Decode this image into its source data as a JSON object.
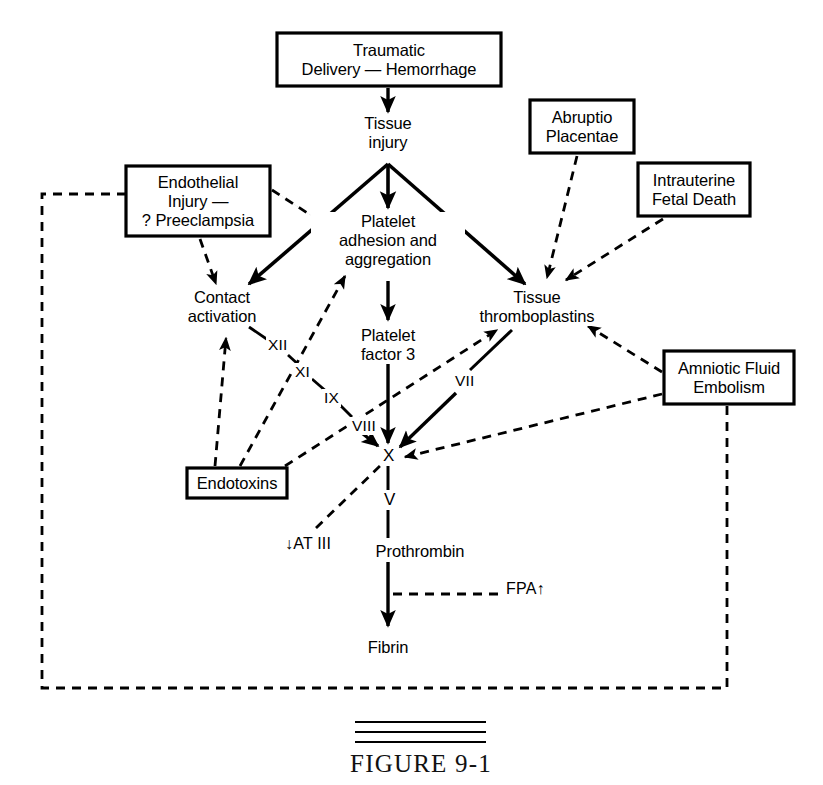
{
  "figure": {
    "caption": "FIGURE 9-1",
    "rule_count": 3
  },
  "style": {
    "ink": "#000000",
    "paper": "#ffffff"
  },
  "boxes": [
    {
      "id": "traumatic-delivery",
      "label": "Traumatic\nDelivery — Hemorrhage",
      "x": 277,
      "y": 33,
      "w": 224,
      "h": 53
    },
    {
      "id": "endothelial-injury",
      "label": "Endothelial\nInjury —\n? Preeclampsia",
      "x": 126,
      "y": 166,
      "w": 144,
      "h": 70
    },
    {
      "id": "abruptio-placentae",
      "label": "Abruptio\nPlacentae",
      "x": 530,
      "y": 100,
      "w": 104,
      "h": 53
    },
    {
      "id": "intrauterine-fetal-death",
      "label": "Intrauterine\nFetal Death",
      "x": 638,
      "y": 163,
      "w": 112,
      "h": 53
    },
    {
      "id": "amniotic-fluid-embolism",
      "label": "Amniotic Fluid\nEmbolism",
      "x": 664,
      "y": 351,
      "w": 130,
      "h": 53
    },
    {
      "id": "endotoxins",
      "label": "Endotoxins",
      "x": 187,
      "y": 468,
      "w": 100,
      "h": 30
    }
  ],
  "nodes": [
    {
      "id": "tissue-injury",
      "label": "Tissue\ninjury",
      "cx": 388,
      "cy": 135
    },
    {
      "id": "platelet-adhesion",
      "label": "Platelet\nadhesion and\naggregation",
      "cx": 388,
      "cy": 240
    },
    {
      "id": "tissue-thromboplastins",
      "label": "Tissue\nthromboplastins",
      "cx": 537,
      "cy": 307
    },
    {
      "id": "contact-activation",
      "label": "Contact\nactivation",
      "cx": 222,
      "cy": 307
    },
    {
      "id": "platelet-factor-3",
      "label": "Platelet\nfactor 3",
      "cx": 388,
      "cy": 345
    },
    {
      "id": "prothrombin",
      "label": "Prothrombin",
      "cx": 420,
      "cy": 552
    },
    {
      "id": "fibrin",
      "label": "Fibrin",
      "cx": 388,
      "cy": 648
    }
  ],
  "factors": [
    {
      "id": "factor-xii",
      "label": "XII",
      "x": 271,
      "y": 345
    },
    {
      "id": "factor-xi",
      "label": "XI",
      "x": 296,
      "y": 372
    },
    {
      "id": "factor-ix",
      "label": "IX",
      "x": 327,
      "y": 398
    },
    {
      "id": "factor-viii",
      "label": "VIII",
      "x": 344,
      "y": 425
    },
    {
      "id": "factor-vii",
      "label": "VII",
      "x": 458,
      "y": 381
    },
    {
      "id": "factor-x",
      "label": "X",
      "x": 382,
      "y": 452
    },
    {
      "id": "factor-v",
      "label": "V",
      "x": 383,
      "y": 498
    }
  ],
  "annotations": [
    {
      "id": "at-iii",
      "label": "↓AT III",
      "x": 285,
      "y": 544
    },
    {
      "id": "fpa",
      "label": "FPA↑",
      "x": 506,
      "y": 588
    }
  ],
  "edges": [
    {
      "id": "traumatic-to-tissue-injury",
      "style": "solid",
      "arrow": true,
      "from": "traumatic-delivery",
      "to": "tissue-injury"
    },
    {
      "id": "tissue-injury-to-contact",
      "style": "solid",
      "arrow": true,
      "from": "tissue-injury",
      "to": "contact-activation"
    },
    {
      "id": "tissue-injury-to-platelet",
      "style": "solid",
      "arrow": true,
      "from": "tissue-injury",
      "to": "platelet-adhesion"
    },
    {
      "id": "tissue-injury-to-thromboplastins",
      "style": "solid",
      "arrow": true,
      "from": "tissue-injury",
      "to": "tissue-thromboplastins"
    },
    {
      "id": "endothelial-to-contact",
      "style": "dashed",
      "arrow": true,
      "from": "endothelial-injury",
      "to": "contact-activation"
    },
    {
      "id": "endothelial-to-platelet",
      "style": "dashed",
      "arrow": true,
      "from": "endothelial-injury",
      "to": "platelet-adhesion"
    },
    {
      "id": "abruptio-to-thromboplastins",
      "style": "dashed",
      "arrow": true,
      "from": "abruptio-placentae",
      "to": "tissue-thromboplastins"
    },
    {
      "id": "fetal-death-to-thromboplastins",
      "style": "dashed",
      "arrow": true,
      "from": "intrauterine-fetal-death",
      "to": "tissue-thromboplastins"
    },
    {
      "id": "platelet-to-factor3",
      "style": "solid",
      "arrow": true,
      "from": "platelet-adhesion",
      "to": "platelet-factor-3"
    },
    {
      "id": "factor3-to-x",
      "style": "solid",
      "arrow": true,
      "from": "platelet-factor-3",
      "to": "factor-x"
    },
    {
      "id": "contact-to-xii-xi-ix-viii",
      "style": "solid",
      "arrow": false,
      "from": "contact-activation",
      "to": "factor-viii"
    },
    {
      "id": "ix-to-x",
      "style": "solid",
      "arrow": true,
      "from": "factor-viii",
      "to": "factor-x"
    },
    {
      "id": "thromboplastins-to-x-vii",
      "style": "solid",
      "arrow": true,
      "from": "tissue-thromboplastins",
      "to": "factor-x"
    },
    {
      "id": "amniotic-to-thromboplastins",
      "style": "dashed",
      "arrow": true,
      "from": "amniotic-fluid-embolism",
      "to": "tissue-thromboplastins"
    },
    {
      "id": "amniotic-to-x",
      "style": "dashed",
      "arrow": true,
      "from": "amniotic-fluid-embolism",
      "to": "factor-x"
    },
    {
      "id": "endotoxins-to-contact",
      "style": "dashed",
      "arrow": true,
      "from": "endotoxins",
      "to": "contact-activation"
    },
    {
      "id": "endotoxins-to-platelet",
      "style": "dashed",
      "arrow": true,
      "from": "endotoxins",
      "to": "platelet-adhesion"
    },
    {
      "id": "endotoxins-to-thromboplastins",
      "style": "dashed",
      "arrow": true,
      "from": "endotoxins",
      "to": "tissue-thromboplastins"
    },
    {
      "id": "x-to-prothrombin",
      "style": "solid",
      "arrow": false,
      "from": "factor-x",
      "to": "prothrombin"
    },
    {
      "id": "prothrombin-to-fibrin",
      "style": "solid",
      "arrow": true,
      "from": "prothrombin",
      "to": "fibrin"
    },
    {
      "id": "at-iii-to-x",
      "style": "dashed",
      "arrow": false,
      "from": "at-iii",
      "to": "factor-x"
    },
    {
      "id": "fpa-to-fibrin-path",
      "style": "dashed",
      "arrow": false,
      "from": "fpa",
      "to": "prothrombin-to-fibrin"
    },
    {
      "id": "feedback-loop",
      "style": "dashed",
      "arrow": false,
      "from": "amniotic-fluid-embolism",
      "to": "endothelial-injury"
    }
  ]
}
